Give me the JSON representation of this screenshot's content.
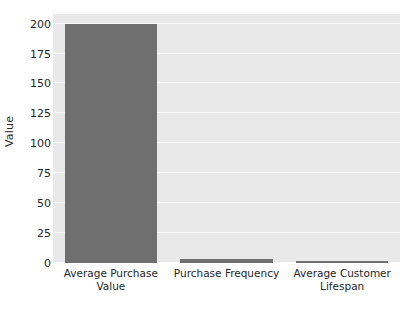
{
  "chart_data": {
    "type": "bar",
    "title": "",
    "subtitle": "",
    "xlabel": "",
    "ylabel": "Value",
    "categories": [
      "Average Purchase\nValue",
      "Purchase Frequency",
      "Average Customer\nLifespan"
    ],
    "values": [
      200,
      3,
      2
    ],
    "ylim": [
      0,
      208
    ],
    "yticks": [
      0,
      25,
      50,
      75,
      100,
      125,
      150,
      175,
      200
    ],
    "ytick_labels": [
      "0",
      "25",
      "50",
      "75",
      "100",
      "125",
      "150",
      "175",
      "200"
    ],
    "grid": true,
    "grid_axis": "y",
    "legend": null,
    "bar_color": "#6f6f6f",
    "plot_background": "#e9e9e9",
    "figure_background": "#ffffff",
    "gridline_color": "#fafafa",
    "text_color": "#262626"
  }
}
